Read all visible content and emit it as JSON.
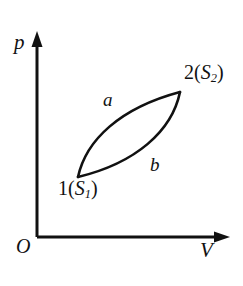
{
  "figure": {
    "type": "pv-diagram",
    "background_color": "#ffffff",
    "stroke_color": "#111111",
    "axes": {
      "y_axis": {
        "label": "p",
        "name": "pressure",
        "arrow": "up",
        "x": 37,
        "y_top": 35,
        "y_bottom": 237
      },
      "x_axis": {
        "label": "V",
        "name": "volume",
        "arrow": "right",
        "y": 237,
        "x_left": 37,
        "x_right": 228
      },
      "origin_label": "O"
    },
    "process_paths": [
      {
        "id": "a",
        "label": "a",
        "description": "upper curve from state 1 to state 2, bulging up-left"
      },
      {
        "id": "b",
        "label": "b",
        "description": "lower curve from state 1 to state 2, bulging down-right"
      }
    ],
    "states": [
      {
        "id": "1",
        "number": "1",
        "open_paren": "(",
        "entropy_symbol": "S",
        "entropy_subscript": "1",
        "close_paren": ")",
        "x": 78,
        "y": 177
      },
      {
        "id": "2",
        "number": "2",
        "open_paren": "(",
        "entropy_symbol": "S",
        "entropy_subscript": "2",
        "close_paren": ")",
        "x": 180,
        "y": 92
      }
    ]
  }
}
